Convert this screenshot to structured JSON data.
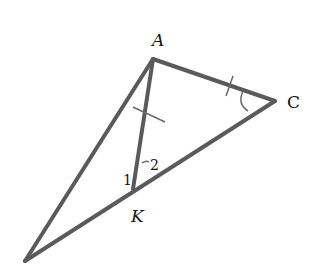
{
  "diagram": {
    "type": "geometry-triangle",
    "stroke_color": "#555555",
    "vertices": {
      "A": {
        "label": "A",
        "x": 153,
        "y": 59
      },
      "C": {
        "label": "C",
        "x": 275,
        "y": 101
      },
      "K": {
        "label": "K",
        "x": 133,
        "y": 189
      },
      "B": {
        "label": "",
        "x": 25,
        "y": 261
      }
    },
    "segments": [
      "A-C",
      "C-B",
      "A-B",
      "A-K"
    ],
    "marks": {
      "equal_ticks": [
        "A-K",
        "A-C"
      ],
      "angle_arc": "C"
    },
    "angle_labels": {
      "angle1": "1",
      "angle2": "2"
    }
  }
}
